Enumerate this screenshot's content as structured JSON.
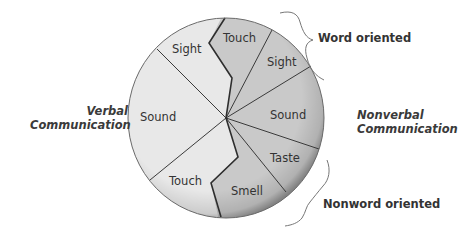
{
  "diagram": {
    "type": "pie-diagram",
    "left_group": {
      "label_line1": "Verbal",
      "label_line2": "Communication",
      "segments": [
        {
          "label": "Sight"
        },
        {
          "label": "Sound"
        },
        {
          "label": "Touch"
        }
      ]
    },
    "right_group": {
      "label_line1": "Nonverbal",
      "label_line2": "Communication",
      "segments": [
        {
          "label": "Touch"
        },
        {
          "label": "Sight"
        },
        {
          "label": "Sound"
        },
        {
          "label": "Taste"
        },
        {
          "label": "Smell"
        }
      ]
    },
    "braces": {
      "word_oriented": "Word oriented",
      "nonword_oriented": "Nonword oriented"
    },
    "colors": {
      "verbal_fill": "#e8e8e8",
      "nonverbal_fill": "#c9c9c9",
      "line": "#3a3a3a",
      "text": "#333333"
    }
  }
}
